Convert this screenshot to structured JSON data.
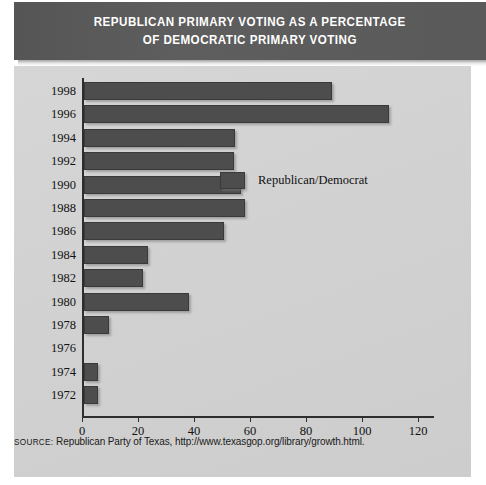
{
  "header": {
    "title_line1": "REPUBLICAN PRIMARY VOTING AS A PERCENTAGE",
    "title_line2": "OF DEMOCRATIC PRIMARY VOTING",
    "title_full": "REPUBLICAN PRIMARY VOTING AS A PERCENTAGE OF DEMOCRATIC PRIMARY VOTING"
  },
  "legend": {
    "entries": [
      {
        "label": "Republican/Democrat",
        "color": "#4d4d4d"
      }
    ]
  },
  "source": {
    "keyword": "SOURCE:",
    "text": " Republican Party of Texas, http://www.texasgop.org/library/growth.html."
  },
  "colors": {
    "banner_background": "#5a5a5a",
    "banner_text": "#ffffff",
    "panel_background": "#d3d3d3",
    "bar": "#4d4d4d",
    "bar_border": "#3a3a3a",
    "axis": "#2e2e2e",
    "text": "#111111"
  },
  "chart_data": {
    "type": "bar",
    "orientation": "horizontal",
    "title": "REPUBLICAN PRIMARY VOTING AS A PERCENTAGE OF DEMOCRATIC PRIMARY VOTING",
    "xlabel": "",
    "ylabel": "",
    "xlim": [
      0,
      130
    ],
    "ylim": null,
    "grid": false,
    "legend_position": "inside-right",
    "xticks": [
      0,
      20,
      40,
      60,
      80,
      100,
      120
    ],
    "categories": [
      "1998",
      "1996",
      "1994",
      "1992",
      "1990",
      "1988",
      "1986",
      "1984",
      "1982",
      "1980",
      "1978",
      "1976",
      "1974",
      "1972"
    ],
    "series": [
      {
        "name": "Republican/Democrat",
        "color": "#4d4d4d",
        "values": [
          88.5,
          109,
          54,
          53.5,
          56,
          57.5,
          50,
          23,
          21,
          37.5,
          9,
          0,
          5,
          5
        ]
      }
    ]
  }
}
